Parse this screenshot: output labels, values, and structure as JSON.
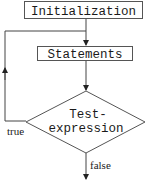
{
  "diagram": {
    "type": "flowchart",
    "nodes": [
      {
        "id": "init",
        "shape": "rectangle",
        "label": "Initialization"
      },
      {
        "id": "statements",
        "shape": "rectangle",
        "label": "Statements"
      },
      {
        "id": "test",
        "shape": "diamond",
        "label_lines": [
          "Test-",
          "expression"
        ]
      }
    ],
    "edges": [
      {
        "from": "init",
        "to": "statements",
        "label": ""
      },
      {
        "from": "statements",
        "to": "test",
        "label": ""
      },
      {
        "from": "test",
        "to": "statements",
        "label": "true"
      },
      {
        "from": "test",
        "to": "exit",
        "label": "false"
      }
    ],
    "colors": {
      "stroke": "#333333",
      "text": "#1a1a1a",
      "background": "#ffffff"
    }
  }
}
